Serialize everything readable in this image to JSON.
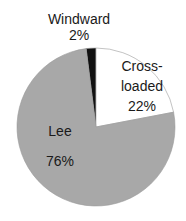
{
  "chart_data": {
    "type": "pie",
    "title": "",
    "categories": [
      "Windward",
      "Cross-loaded",
      "Lee"
    ],
    "values": [
      2,
      22,
      76
    ],
    "labels": [
      {
        "name": "Windward",
        "pct": "2%"
      },
      {
        "name": "Cross-",
        "name2": "loaded",
        "pct": "22%"
      },
      {
        "name": "Lee",
        "pct": "76%"
      }
    ],
    "colors": {
      "Windward": "#111111",
      "Cross-loaded": "#ffffff",
      "Lee": "#a8a8a8"
    },
    "start_angle_deg": -7.2,
    "legend": "none"
  }
}
